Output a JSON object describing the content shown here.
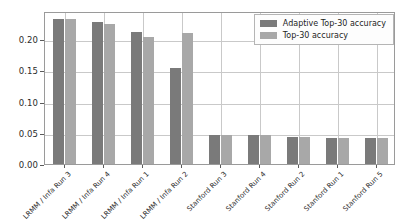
{
  "chart_data": {
    "type": "bar",
    "title": "",
    "xlabel": "",
    "ylabel": "",
    "ylim": [
      0.0,
      0.245
    ],
    "yticks": [
      "0.00",
      "0.05",
      "0.10",
      "0.15",
      "0.20"
    ],
    "ytick_values": [
      0.0,
      0.05,
      0.1,
      0.15,
      0.2
    ],
    "grid": true,
    "grid_axis": "both",
    "legend_position": "upper right",
    "categories": [
      "LRMM / Infa Run 3",
      "LRMM / Infa Run 4",
      "LRMM / Infa Run 1",
      "LRMM / Infa Run 2",
      "Stanford Run 3",
      "Stanford Run 4",
      "Stanford Run 2",
      "Stanford Run 1",
      "Stanford Run 5"
    ],
    "series": [
      {
        "name": "Adaptive Top-30 accuracy",
        "color": "#7a7a7a",
        "values": [
          0.232,
          0.228,
          0.212,
          0.153,
          0.047,
          0.046,
          0.044,
          0.042,
          0.041
        ]
      },
      {
        "name": "Top-30 accuracy",
        "color": "#a8a8a8",
        "values": [
          0.233,
          0.225,
          0.203,
          0.21,
          0.047,
          0.046,
          0.044,
          0.042,
          0.041
        ]
      }
    ]
  },
  "legend": {
    "entries": [
      {
        "label": "Adaptive Top-30 accuracy"
      },
      {
        "label": "Top-30 accuracy"
      }
    ]
  },
  "colors": {
    "series_adaptive": "#7a7a7a",
    "series_top30": "#a8a8a8",
    "grid": "#c9c9c9",
    "axis": "#9a9a9a",
    "background": "#ffffff",
    "text": "#2b2b2b"
  }
}
